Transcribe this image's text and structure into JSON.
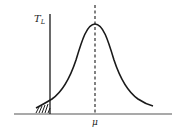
{
  "diagram": {
    "type": "bell-curve-threshold",
    "y_axis_label": "T",
    "y_axis_label_subscript": "L",
    "x_marker_label": "μ",
    "elements": {
      "curve": "bell-shaped distribution peaking at μ",
      "dashed_line": "vertical dashed line at μ",
      "threshold_line": "vertical solid line at T_L",
      "shaded_region": "hatched tail left of T_L"
    },
    "colors": {
      "stroke": "#1a1a1a",
      "background": "#ffffff"
    }
  }
}
